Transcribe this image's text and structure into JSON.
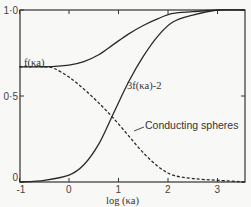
{
  "chart_data": {
    "type": "line",
    "title": "",
    "xlabel": "log (κa)",
    "ylabel": "",
    "xlim": [
      -1,
      3.55
    ],
    "ylim": [
      0,
      1.0
    ],
    "x_ticks": [
      "-1",
      "0",
      "1",
      "2",
      "3"
    ],
    "y_ticks": [
      "0",
      "0·5",
      "1·0"
    ],
    "grid": false,
    "legend": "none (inline labels)",
    "series": [
      {
        "name": "f(κa)",
        "style": "solid",
        "x": [
          -1,
          -0.5,
          0,
          0.3,
          0.6,
          0.9,
          1.2,
          1.5,
          1.8,
          2.1,
          2.5,
          3.0,
          3.55
        ],
        "y": [
          0.67,
          0.67,
          0.68,
          0.7,
          0.74,
          0.8,
          0.86,
          0.91,
          0.95,
          0.98,
          0.99,
          1.0,
          1.0
        ]
      },
      {
        "name": "3f(κa)-2",
        "style": "solid",
        "x": [
          -1,
          -0.5,
          0,
          0.3,
          0.6,
          0.9,
          1.2,
          1.5,
          1.8,
          2.1,
          2.5,
          3.0,
          3.55
        ],
        "y": [
          0.0,
          0.01,
          0.04,
          0.1,
          0.22,
          0.4,
          0.58,
          0.73,
          0.85,
          0.93,
          0.97,
          1.0,
          1.0
        ]
      },
      {
        "name": "Conducting spheres",
        "style": "dashed",
        "x": [
          -1,
          -0.5,
          -0.3,
          0,
          0.3,
          0.6,
          0.9,
          1.2,
          1.5,
          1.8,
          2.1,
          2.5,
          3.0,
          3.55
        ],
        "y": [
          0.67,
          0.67,
          0.66,
          0.61,
          0.54,
          0.46,
          0.37,
          0.27,
          0.17,
          0.09,
          0.04,
          0.02,
          0.01,
          0.0
        ]
      }
    ],
    "annotations": [
      {
        "text": "f(κa)",
        "near": "f(κa) curve left plateau"
      },
      {
        "text": "3f(κa)-2",
        "near": "rising curve at x≈1.2"
      },
      {
        "text": "Conducting spheres",
        "near": "dashed curve with leader arrow at x≈1.3"
      }
    ]
  },
  "labels": {
    "xlabel": "log (κa)",
    "f": "f(κa)",
    "g": "3f(κa)-2",
    "cond": "Conducting spheres",
    "xt": [
      "-1",
      "0",
      "1",
      "2",
      "3"
    ],
    "yt": [
      "0",
      "0·5",
      "1·0"
    ]
  }
}
